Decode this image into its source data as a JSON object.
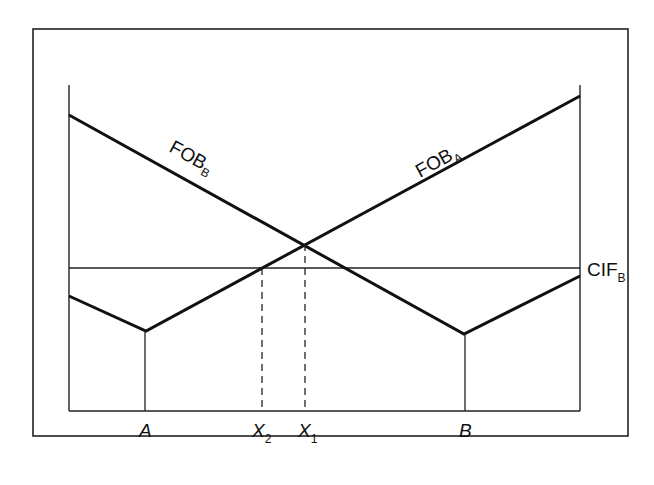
{
  "diagram": {
    "type": "spatial price / delivered cost diagram",
    "curves": {
      "fob_b": {
        "label": "FOB",
        "subscript": "B"
      },
      "fob_a": {
        "label": "FOB",
        "subscript": "A"
      },
      "cif_b": {
        "label": "CIF",
        "subscript": "B"
      }
    },
    "x_axis_labels": {
      "a": {
        "label": "A",
        "subscript": ""
      },
      "x2": {
        "label": "X",
        "subscript": "2"
      },
      "x1": {
        "label": "X",
        "subscript": "1"
      },
      "b": {
        "label": "B",
        "subscript": ""
      }
    },
    "points": {
      "a_vertex": [
        144,
        331
      ],
      "b_vertex": [
        464,
        334
      ],
      "fob_intersection": [
        304,
        244
      ],
      "fob_a_cif_intersection": [
        262,
        268
      ]
    }
  }
}
